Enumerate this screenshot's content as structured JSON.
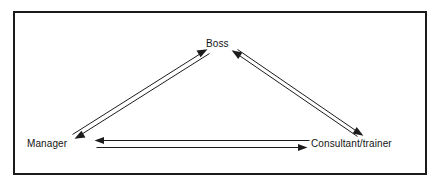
{
  "diagram": {
    "type": "relationship-triangle",
    "border_color": "#1a1a1a",
    "line_color": "#1c1c1c",
    "background_color": "#ffffff",
    "nodes": [
      {
        "id": "boss",
        "label": "Boss",
        "position": "top-center"
      },
      {
        "id": "manager",
        "label": "Manager",
        "position": "bottom-left"
      },
      {
        "id": "consultant",
        "label": "Consultant/trainer",
        "position": "bottom-right"
      }
    ],
    "edges": [
      {
        "id": "manager-to-boss",
        "from": "Manager",
        "to": "Boss",
        "direction": "forward"
      },
      {
        "id": "boss-to-manager",
        "from": "Boss",
        "to": "Manager",
        "direction": "forward"
      },
      {
        "id": "consultant-to-boss",
        "from": "Consultant/trainer",
        "to": "Boss",
        "direction": "forward"
      },
      {
        "id": "boss-to-consultant",
        "from": "Boss",
        "to": "Consultant/trainer",
        "direction": "forward"
      },
      {
        "id": "consultant-to-manager",
        "from": "Consultant/trainer",
        "to": "Manager",
        "direction": "forward"
      },
      {
        "id": "manager-to-consultant",
        "from": "Manager",
        "to": "Consultant/trainer",
        "direction": "forward"
      }
    ]
  }
}
